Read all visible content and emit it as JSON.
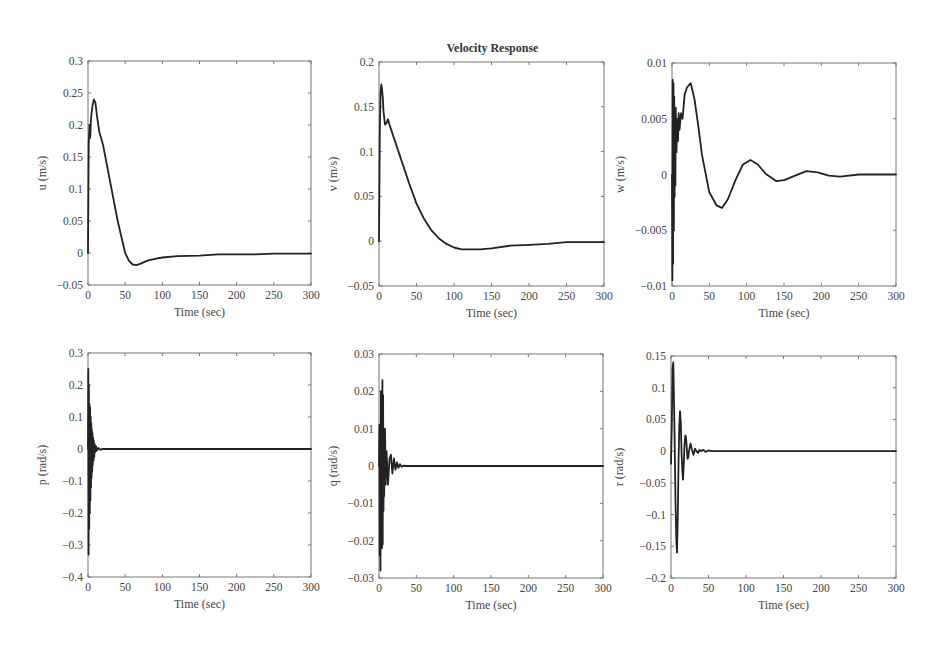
{
  "figure": {
    "title": "Velocity Response"
  },
  "chart_data": [
    {
      "type": "line",
      "title": "",
      "xlabel": "Time (sec)",
      "ylabel": "u (m/s)",
      "xlim": [
        0,
        300
      ],
      "ylim": [
        -0.05,
        0.3
      ],
      "xticks": [
        0,
        50,
        100,
        150,
        200,
        250,
        300
      ],
      "yticks": [
        -0.05,
        0,
        0.05,
        0.1,
        0.15,
        0.2,
        0.25,
        0.3
      ],
      "ytick_labels": [
        "-0.05",
        "0",
        "0.05",
        "0.1",
        "0.15",
        "0.2",
        "0.25",
        "0.3"
      ],
      "box": {
        "x": 88,
        "y": 61,
        "w": 223,
        "h": 224
      },
      "series": [
        {
          "name": "u",
          "x": [
            0,
            1,
            2,
            3,
            4,
            5,
            6,
            8,
            10,
            12,
            15,
            20,
            25,
            30,
            40,
            50,
            55,
            60,
            65,
            70,
            80,
            90,
            100,
            120,
            150,
            175,
            200,
            225,
            250,
            275,
            300
          ],
          "y": [
            0.0,
            0.17,
            0.2,
            0.18,
            0.21,
            0.22,
            0.23,
            0.24,
            0.235,
            0.215,
            0.19,
            0.17,
            0.14,
            0.11,
            0.05,
            0.0,
            -0.012,
            -0.018,
            -0.019,
            -0.017,
            -0.012,
            -0.009,
            -0.007,
            -0.005,
            -0.004,
            -0.002,
            -0.002,
            -0.002,
            -0.001,
            -0.001,
            -0.001
          ]
        }
      ]
    },
    {
      "type": "line",
      "title": "Velocity Response",
      "xlabel": "Time (sec)",
      "ylabel": "v (m/s)",
      "xlim": [
        0,
        300
      ],
      "ylim": [
        -0.05,
        0.2
      ],
      "xticks": [
        0,
        50,
        100,
        150,
        200,
        250,
        300
      ],
      "yticks": [
        -0.05,
        0,
        0.05,
        0.1,
        0.15,
        0.2
      ],
      "ytick_labels": [
        "-0.05",
        "0",
        "0.05",
        "0.1",
        "0.15",
        "0.2"
      ],
      "box": {
        "x": 379,
        "y": 62,
        "w": 225,
        "h": 224
      },
      "series": [
        {
          "name": "v",
          "x": [
            0,
            1,
            2,
            3,
            4,
            5,
            6,
            8,
            10,
            12,
            14,
            16,
            20,
            30,
            40,
            50,
            60,
            70,
            80,
            90,
            100,
            110,
            120,
            135,
            150,
            175,
            200,
            225,
            250,
            275,
            300
          ],
          "y": [
            0.0,
            0.12,
            0.165,
            0.175,
            0.17,
            0.16,
            0.145,
            0.13,
            0.132,
            0.136,
            0.13,
            0.125,
            0.115,
            0.09,
            0.065,
            0.042,
            0.025,
            0.012,
            0.003,
            -0.003,
            -0.007,
            -0.009,
            -0.009,
            -0.009,
            -0.008,
            -0.005,
            -0.004,
            -0.003,
            -0.001,
            -0.001,
            -0.001
          ]
        }
      ]
    },
    {
      "type": "line",
      "title": "",
      "xlabel": "Time (sec)",
      "ylabel": "w (m/s)",
      "xlim": [
        0,
        300
      ],
      "ylim": [
        -0.01,
        0.01
      ],
      "xticks": [
        0,
        50,
        100,
        150,
        200,
        250,
        300
      ],
      "yticks": [
        -0.01,
        -0.005,
        0,
        0.005,
        0.01
      ],
      "ytick_labels": [
        "-0.01",
        "-0.005",
        "0",
        "0.005",
        "0.01"
      ],
      "box": {
        "x": 672,
        "y": 63,
        "w": 224,
        "h": 223
      },
      "series": [
        {
          "name": "w",
          "x": [
            0,
            0.5,
            1,
            1.5,
            2,
            2.5,
            3,
            3.5,
            4,
            4.5,
            5,
            6,
            7,
            8,
            9,
            10,
            12,
            14,
            17,
            20,
            25,
            30,
            35,
            40,
            50,
            60,
            67,
            75,
            85,
            95,
            105,
            115,
            125,
            140,
            150,
            165,
            180,
            195,
            210,
            225,
            250,
            275,
            300
          ],
          "y": [
            0.0,
            -0.0095,
            0.0085,
            -0.008,
            0.0082,
            -0.005,
            0.007,
            -0.002,
            0.006,
            -0.001,
            0.006,
            0.002,
            0.005,
            0.003,
            0.0055,
            0.004,
            0.0055,
            0.005,
            0.0072,
            0.0078,
            0.0082,
            0.0068,
            0.0045,
            0.0018,
            -0.0016,
            -0.0028,
            -0.003,
            -0.0022,
            -0.0005,
            0.0009,
            0.0013,
            0.0009,
            0.0001,
            -0.0006,
            -0.0005,
            -0.0001,
            0.0003,
            0.0002,
            -0.0001,
            -0.0002,
            0.0,
            0.0,
            0.0
          ]
        }
      ]
    },
    {
      "type": "line",
      "title": "",
      "xlabel": "Time (sec)",
      "ylabel": "p (rad/s)",
      "xlim": [
        0,
        300
      ],
      "ylim": [
        -0.4,
        0.3
      ],
      "xticks": [
        0,
        50,
        100,
        150,
        200,
        250,
        300
      ],
      "yticks": [
        -0.4,
        -0.3,
        -0.2,
        -0.1,
        0,
        0.1,
        0.2,
        0.3
      ],
      "ytick_labels": [
        "-0.4",
        "-0.3",
        "-0.2",
        "-0.1",
        "0",
        "0.1",
        "0.2",
        "0.3"
      ],
      "box": {
        "x": 88,
        "y": 353,
        "w": 223,
        "h": 224
      },
      "series": [
        {
          "name": "p",
          "x": [
            0,
            0.4,
            0.8,
            1.2,
            1.6,
            2.0,
            2.4,
            2.8,
            3.2,
            3.6,
            4.0,
            4.4,
            4.8,
            5.2,
            5.6,
            6.0,
            6.5,
            7,
            7.5,
            8,
            8.5,
            9,
            10,
            11,
            12,
            14,
            16,
            20,
            110,
            300
          ],
          "y": [
            0.0,
            0.25,
            -0.33,
            0.2,
            -0.25,
            0.14,
            -0.2,
            0.13,
            -0.16,
            0.1,
            -0.12,
            0.08,
            -0.09,
            0.06,
            -0.07,
            0.05,
            -0.05,
            0.035,
            -0.035,
            0.025,
            -0.025,
            0.015,
            -0.01,
            0.008,
            -0.005,
            0.003,
            -0.002,
            0.0,
            0.0,
            0.0
          ]
        }
      ]
    },
    {
      "type": "line",
      "title": "",
      "xlabel": "Time (sec)",
      "ylabel": "q (rad/s)",
      "xlim": [
        0,
        300
      ],
      "ylim": [
        -0.03,
        0.03
      ],
      "xticks": [
        0,
        50,
        100,
        150,
        200,
        250,
        300
      ],
      "yticks": [
        -0.03,
        -0.02,
        -0.01,
        0,
        0.01,
        0.02,
        0.03
      ],
      "ytick_labels": [
        "-0.03",
        "-0.02",
        "-0.01",
        "0",
        "0.01",
        "0.02",
        "0.03"
      ],
      "box": {
        "x": 379,
        "y": 354,
        "w": 224,
        "h": 224
      },
      "series": [
        {
          "name": "q",
          "x": [
            0,
            0.5,
            1,
            1.5,
            2,
            2.5,
            3,
            3.5,
            4,
            4.5,
            5,
            5.5,
            6,
            6.5,
            7,
            8,
            9,
            10,
            12,
            14,
            16,
            18,
            20,
            22,
            24,
            26,
            28,
            30,
            33,
            36,
            300
          ],
          "y": [
            0.0,
            0.011,
            -0.024,
            0.008,
            -0.028,
            0.02,
            -0.015,
            0.019,
            -0.022,
            0.023,
            -0.021,
            0.019,
            -0.012,
            0.01,
            -0.008,
            0.01,
            -0.005,
            0.004,
            -0.005,
            0.002,
            0.003,
            -0.002,
            0.002,
            -0.001,
            0.001,
            -0.0005,
            0.0005,
            -0.0002,
            0.0001,
            0.0,
            0.0
          ]
        }
      ]
    },
    {
      "type": "line",
      "title": "",
      "xlabel": "Time (sec)",
      "ylabel": "r (rad/s)",
      "xlim": [
        0,
        300
      ],
      "ylim": [
        -0.2,
        0.15
      ],
      "xticks": [
        0,
        50,
        100,
        150,
        200,
        250,
        300
      ],
      "yticks": [
        -0.2,
        -0.15,
        -0.1,
        -0.05,
        0,
        0.05,
        0.1,
        0.15
      ],
      "ytick_labels": [
        "-0.2",
        "-0.15",
        "-0.1",
        "-0.05",
        "0",
        "0.05",
        "0.1",
        "0.15"
      ],
      "box": {
        "x": 671,
        "y": 356,
        "w": 225,
        "h": 222
      },
      "series": [
        {
          "name": "r",
          "x": [
            0,
            1,
            2,
            3,
            4,
            5,
            6,
            7,
            8,
            9,
            10,
            11,
            12,
            13,
            14,
            15,
            16,
            17,
            18,
            19,
            20,
            21,
            22,
            23,
            24,
            26,
            28,
            30,
            32,
            34,
            36,
            38,
            40,
            43,
            46,
            50,
            55,
            60,
            300
          ],
          "y": [
            -0.02,
            0.04,
            0.13,
            0.14,
            0.08,
            0.0,
            -0.08,
            -0.14,
            -0.16,
            -0.1,
            -0.02,
            0.04,
            0.063,
            0.045,
            0.0,
            -0.03,
            -0.045,
            -0.02,
            0.01,
            0.025,
            0.022,
            0.005,
            -0.012,
            -0.01,
            0.0,
            0.012,
            0.002,
            -0.006,
            0.004,
            0.0,
            -0.003,
            0.002,
            0.0,
            0.002,
            -0.001,
            0.001,
            0.0,
            0.0,
            0.0
          ]
        }
      ]
    }
  ]
}
